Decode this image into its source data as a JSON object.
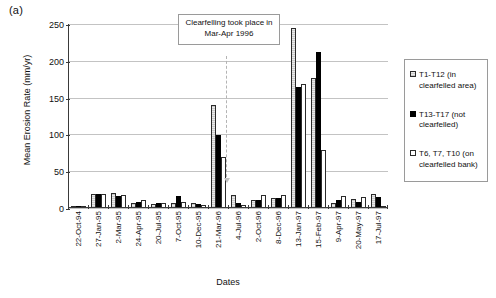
{
  "panel_label": "(a)",
  "annotation": {
    "text": "Clearfelling took place in Mar-Apr 1996"
  },
  "legend": {
    "items": [
      {
        "key": "s0",
        "label": "T1-T12 (in clearfelled area)"
      },
      {
        "key": "s1",
        "label": "T13-T17 (not clearfelled)"
      },
      {
        "key": "s2",
        "label": "T6, T7, T10 (on clearfelled bank)"
      }
    ]
  },
  "chart_data": {
    "type": "bar",
    "title": "",
    "xlabel": "Dates",
    "ylabel": "Mean Erosion Rate (mm/yr)",
    "ylim": [
      0,
      250
    ],
    "yticks": [
      0,
      50,
      100,
      150,
      200,
      250
    ],
    "grid": true,
    "legend_position": "right",
    "categories": [
      "22-Oct-94",
      "27-Jan-95",
      "2-Mar-95",
      "24-Apr-95",
      "20-Jul-95",
      "7-Oct-95",
      "10-Dec-95",
      "21-Mar-96",
      "4-Jul-96",
      "2-Oct-96",
      "8-Dec-96",
      "13-Jan-97",
      "15-Feb-97",
      "9-Apr-97",
      "20-May-97",
      "17-Jul-97"
    ],
    "series": [
      {
        "name": "T1-T12 (in clearfelled area)",
        "values": [
          0,
          18,
          19,
          5,
          4,
          5,
          6,
          138,
          16,
          10,
          12,
          243,
          175,
          5,
          11,
          18
        ]
      },
      {
        "name": "T13-T17 (not clearfelled)",
        "values": [
          0,
          18,
          15,
          7,
          5,
          15,
          4,
          98,
          6,
          9,
          12,
          163,
          210,
          10,
          7,
          14
        ]
      },
      {
        "name": "T6, T7, T10 (on clearfelled bank)",
        "values": [
          0,
          18,
          16,
          10,
          5,
          7,
          3,
          68,
          3,
          16,
          16,
          167,
          78,
          15,
          13,
          0
        ]
      }
    ],
    "annotations": [
      {
        "text": "Clearfelling took place in Mar-Apr 1996",
        "at_category": "21-Mar-96",
        "style": "dashed-vertical-arrow"
      }
    ],
    "colors": {
      "series_0": "#d8d8d8",
      "series_1": "#000000",
      "series_2": "#ffffff",
      "grid": "#c3c3c3",
      "axis": "#3a3a3a"
    }
  }
}
